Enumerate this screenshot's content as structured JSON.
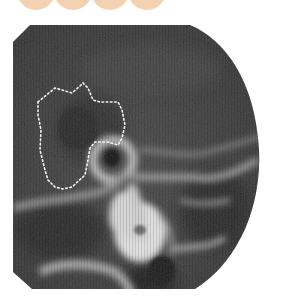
{
  "figure": {
    "type": "radiograph",
    "annotation": "dotted-outline-region",
    "colors": {
      "decor_circle": "#f3d2b3",
      "background": "#ffffff",
      "film_dark": "#2e2e2e",
      "film_mid": "#4a4a4a",
      "bone_bright": "#e6e6e6",
      "outline_dots": "#f2f2f2"
    }
  },
  "decor": {
    "circles": [
      {
        "cx": 36
      },
      {
        "cx": 73
      },
      {
        "cx": 110
      },
      {
        "cx": 147
      }
    ]
  }
}
